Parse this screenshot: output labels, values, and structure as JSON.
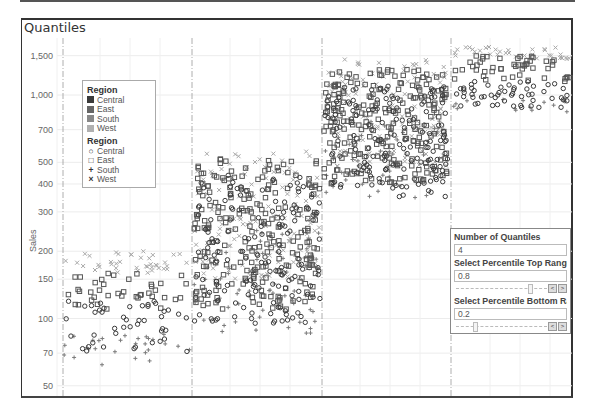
{
  "title": "Quantiles",
  "chart_data": {
    "type": "scatter",
    "title": "Quantiles",
    "xlabel": "",
    "ylabel": "Sales",
    "yscale": "log",
    "ylim": [
      45,
      1800
    ],
    "y_ticks": [
      {
        "value": 1500,
        "label": "1,500"
      },
      {
        "value": 1000,
        "label": "1,000"
      },
      {
        "value": 700,
        "label": "700"
      },
      {
        "value": 500,
        "label": "500"
      },
      {
        "value": 400,
        "label": "400"
      },
      {
        "value": 300,
        "label": "300"
      },
      {
        "value": 200,
        "label": "200"
      },
      {
        "value": 150,
        "label": "150"
      },
      {
        "value": 100,
        "label": "100"
      },
      {
        "value": 70,
        "label": "70"
      },
      {
        "value": 50,
        "label": "50"
      }
    ],
    "grid": true,
    "panes": [
      {
        "name": "Quantile 1",
        "x_range": [
          63,
          190
        ],
        "bands": {
          "West": [
            160,
            200
          ],
          "East": [
            110,
            160
          ],
          "Central": [
            70,
            120
          ],
          "South": [
            62,
            85
          ]
        },
        "counts": {
          "West": 40,
          "East": 40,
          "Central": 45,
          "South": 28
        }
      },
      {
        "name": "Quantile 2",
        "x_range": [
          194,
          320
        ],
        "bands": {
          "West": [
            150,
            560
          ],
          "East": [
            110,
            540
          ],
          "Central": [
            95,
            440
          ],
          "South": [
            85,
            250
          ]
        },
        "counts": {
          "West": 130,
          "East": 230,
          "Central": 160,
          "South": 70
        }
      },
      {
        "name": "Quantile 3",
        "x_range": [
          324,
          448
        ],
        "bands": {
          "West": [
            480,
            1450
          ],
          "East": [
            400,
            1300
          ],
          "Central": [
            350,
            1100
          ],
          "South": [
            340,
            800
          ]
        },
        "counts": {
          "West": 130,
          "East": 230,
          "Central": 160,
          "South": 55
        }
      },
      {
        "name": "Quantile 4",
        "x_range": [
          453,
          570
        ],
        "bands": {
          "West": [
            1450,
            1650
          ],
          "East": [
            1150,
            1500
          ],
          "Central": [
            880,
            1150
          ],
          "South": [
            840,
            960
          ]
        },
        "counts": {
          "West": 35,
          "East": 50,
          "Central": 55,
          "South": 16
        }
      }
    ],
    "series": [
      {
        "name": "Central",
        "marker": "circle",
        "color": "#3a3a3a"
      },
      {
        "name": "East",
        "marker": "square",
        "color": "#555555"
      },
      {
        "name": "South",
        "marker": "plus",
        "color": "#7a7a7a"
      },
      {
        "name": "West",
        "marker": "x",
        "color": "#a8a8a8"
      }
    ],
    "legend_position": "inside-top-left"
  },
  "legend": {
    "color_title": "Region",
    "shape_title": "Region",
    "items": [
      {
        "label": "Central",
        "color": "#3a3a3a",
        "symbol": "○"
      },
      {
        "label": "East",
        "color": "#666666",
        "symbol": "□"
      },
      {
        "label": "South",
        "color": "#888888",
        "symbol": "+"
      },
      {
        "label": "West",
        "color": "#b0b0b0",
        "symbol": "×"
      }
    ]
  },
  "controls": {
    "quantiles_label": "Number of Quantiles",
    "quantiles_value": "4",
    "top_label": "Select Percentile Top Range",
    "top_value": "0.8",
    "bottom_label": "Select Percentile Bottom Ra..",
    "bottom_value": "0.2",
    "prev_glyph": "<",
    "next_glyph": ">"
  }
}
